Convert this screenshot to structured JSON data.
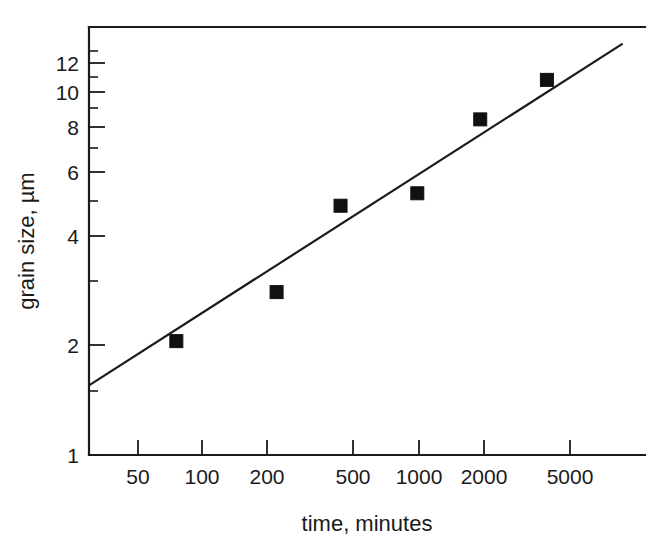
{
  "chart_data": {
    "type": "scatter",
    "title": "",
    "xlabel": "time, minutes",
    "ylabel": "grain size, µm",
    "xscale": "log",
    "yscale": "log",
    "xlim": [
      30,
      9000
    ],
    "ylim": [
      1,
      13.6
    ],
    "grid": false,
    "legend": null,
    "x_tick_labels": [
      "50",
      "100",
      "200",
      "500",
      "1000",
      "2000",
      "5000"
    ],
    "x_tick_values": [
      50,
      100,
      200,
      500,
      1000,
      2000,
      5000
    ],
    "y_tick_labels": [
      "1",
      "2",
      "4",
      "6",
      "8",
      "10",
      "12"
    ],
    "y_tick_values": [
      1,
      2,
      4,
      6,
      8,
      10,
      12
    ],
    "series": [
      {
        "name": "grain size measurements",
        "marker": "filled-square",
        "color": "#111111",
        "points": [
          {
            "x": 76,
            "y": 2.05
          },
          {
            "x": 222,
            "y": 2.8
          },
          {
            "x": 440,
            "y": 4.85
          },
          {
            "x": 1000,
            "y": 5.25
          },
          {
            "x": 1960,
            "y": 8.4
          },
          {
            "x": 4000,
            "y": 10.8
          }
        ]
      },
      {
        "name": "fitted trend line",
        "marker": "none",
        "color": "#1a1a1a",
        "line_endpoints": [
          {
            "x": 30,
            "y": 1.55
          },
          {
            "x": 9000,
            "y": 13.6
          }
        ]
      }
    ]
  },
  "axes": {
    "x_title": "time, minutes",
    "y_title": "grain size, µm"
  }
}
